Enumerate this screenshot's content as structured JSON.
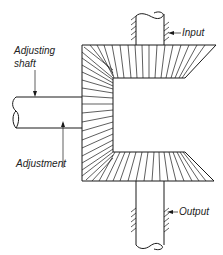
{
  "diagram": {
    "type": "mechanical-schematic",
    "labels": {
      "adjusting_shaft_line1": "Adjusting",
      "adjusting_shaft_line2": "shaft",
      "input": "Input",
      "adjustment": "Adjustment",
      "output": "Output"
    },
    "components": [
      {
        "id": "adjusting-shaft",
        "label": "Adjusting shaft",
        "orientation": "horizontal",
        "side": "left"
      },
      {
        "id": "input-shaft",
        "label": "Input",
        "orientation": "vertical",
        "side": "top"
      },
      {
        "id": "output-shaft",
        "label": "Output",
        "orientation": "vertical",
        "side": "bottom"
      },
      {
        "id": "upper-bevel-gear",
        "label": "",
        "attached_to": "input-shaft"
      },
      {
        "id": "lower-bevel-gear",
        "label": "",
        "attached_to": "output-shaft"
      },
      {
        "id": "carrier",
        "label": "",
        "attached_to": "adjusting-shaft"
      }
    ],
    "arrows": [
      {
        "label": "Adjusting shaft",
        "direction": "down",
        "target": "adjusting-shaft"
      },
      {
        "label": "Adjustment",
        "direction": "up",
        "target": "adjusting-shaft"
      },
      {
        "label": "Input",
        "direction": "left",
        "target": "input-shaft"
      },
      {
        "label": "Output",
        "direction": "left",
        "target": "output-shaft"
      }
    ],
    "colors": {
      "line": "#1a1a1a",
      "background": "#ffffff"
    }
  }
}
